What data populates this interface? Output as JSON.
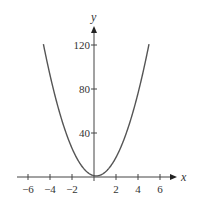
{
  "chart_data": {
    "type": "line",
    "title": "",
    "xlabel": "x",
    "ylabel": "y",
    "xlim": [
      -7.5,
      7.5
    ],
    "ylim": [
      0,
      130
    ],
    "x_ticks": [
      -6,
      -4,
      -2,
      2,
      4,
      6
    ],
    "x_tick_labels": [
      "−6",
      "−4",
      "−2",
      "2",
      "4",
      "6"
    ],
    "y_ticks": [
      40,
      80,
      120
    ],
    "y_tick_labels": [
      "40",
      "80",
      "120"
    ],
    "grid": false,
    "legend": null,
    "series": [
      {
        "name": "parabola",
        "color": "#555555",
        "x": [
          -4.6,
          -4,
          -3,
          -2,
          -1,
          0,
          0.2,
          1,
          2,
          3,
          4,
          5.0
        ],
        "y": [
          121,
          91,
          53,
          25,
          8,
          1.2,
          1,
          4.3,
          17.8,
          41.8,
          76,
          121
        ]
      }
    ]
  }
}
